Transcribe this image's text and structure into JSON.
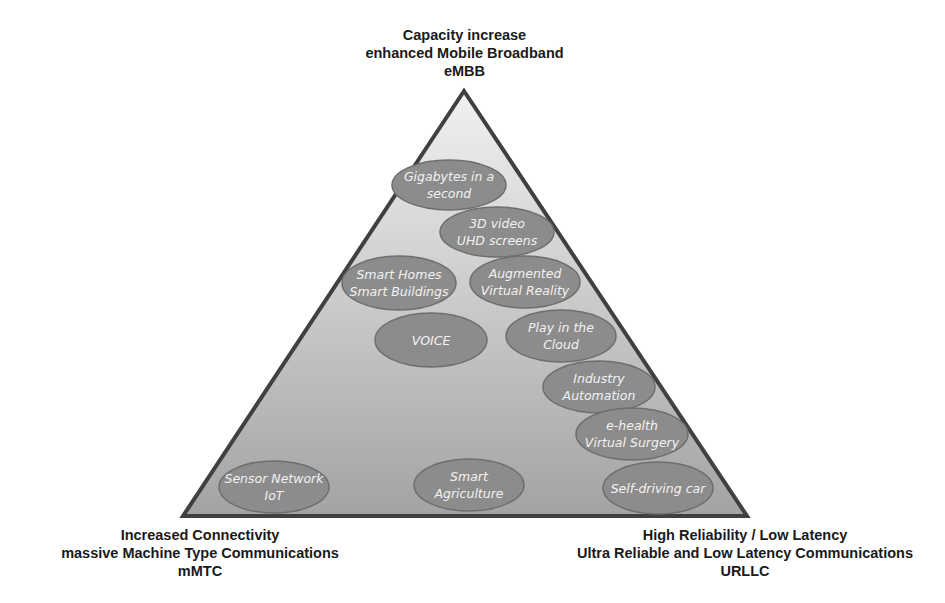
{
  "diagram": {
    "colors": {
      "triangle_top": "#f1f1f1",
      "triangle_bottom": "#a3a3a3",
      "triangle_stroke": "#404040",
      "ellipse_fill": "#8c8c8c",
      "ellipse_stroke": "#6e6e6e",
      "ellipse_text": "#f2f2f2",
      "label_text": "#1a1a1a"
    },
    "corners": {
      "top": {
        "lines": [
          "Capacity increase",
          "enhanced Mobile Broadband",
          "eMBB"
        ]
      },
      "bottom_left": {
        "lines": [
          "Increased Connectivity",
          "massive Machine Type Communications",
          "mMTC"
        ]
      },
      "bottom_right": {
        "lines": [
          "High Reliability / Low Latency",
          "Ultra Reliable and Low Latency Communications",
          "URLLC"
        ]
      }
    },
    "use_cases": [
      {
        "id": "gigabytes",
        "lines": [
          "Gigabytes  in a",
          "second"
        ]
      },
      {
        "id": "3d-video",
        "lines": [
          "3D video",
          "UHD screens"
        ]
      },
      {
        "id": "smart-homes",
        "lines": [
          "Smart Homes",
          "Smart Buildings"
        ]
      },
      {
        "id": "augmented-reality",
        "lines": [
          "Augmented",
          "Virtual Reality"
        ]
      },
      {
        "id": "voice",
        "lines": [
          "VOICE"
        ]
      },
      {
        "id": "play-cloud",
        "lines": [
          "Play in the",
          "Cloud"
        ]
      },
      {
        "id": "industry-automation",
        "lines": [
          "Industry",
          "Automation"
        ]
      },
      {
        "id": "e-health",
        "lines": [
          "e-health",
          "Virtual Surgery"
        ]
      },
      {
        "id": "sensor-network",
        "lines": [
          "Sensor Network",
          "IoT"
        ]
      },
      {
        "id": "smart-agriculture",
        "lines": [
          "Smart",
          "Agriculture"
        ]
      },
      {
        "id": "self-driving",
        "lines": [
          "Self-driving  car"
        ]
      }
    ]
  }
}
